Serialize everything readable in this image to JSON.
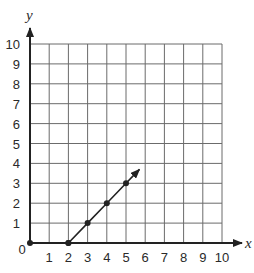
{
  "chart_data": {
    "type": "line",
    "title": "",
    "xlabel": "x",
    "ylabel": "y",
    "xlim": [
      0,
      10
    ],
    "ylim": [
      0,
      10
    ],
    "grid": true,
    "x_ticks": [
      "1",
      "2",
      "3",
      "4",
      "5",
      "6",
      "7",
      "8",
      "9",
      "10"
    ],
    "y_ticks": [
      "1",
      "2",
      "3",
      "4",
      "5",
      "6",
      "7",
      "8",
      "9",
      "10"
    ],
    "origin_label": "0",
    "series": [
      {
        "name": "segment-on-x-axis",
        "type": "line",
        "points": [
          [
            0,
            0
          ],
          [
            2,
            0
          ]
        ],
        "markers": [
          [
            0,
            0
          ],
          [
            2,
            0
          ]
        ]
      },
      {
        "name": "ray",
        "type": "line",
        "points": [
          [
            2,
            0
          ],
          [
            3,
            1
          ],
          [
            4,
            2
          ],
          [
            5,
            3
          ]
        ],
        "markers": [
          [
            2,
            0
          ],
          [
            3,
            1
          ],
          [
            4,
            2
          ],
          [
            5,
            3
          ]
        ],
        "arrow_end": [
          5.7,
          3.7
        ]
      }
    ]
  },
  "style": {
    "grid_color": "#6b6b6b",
    "axis_color": "#222222",
    "line_color": "#222222"
  }
}
